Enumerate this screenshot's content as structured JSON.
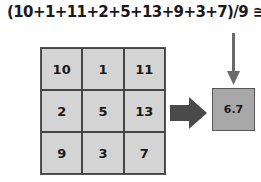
{
  "formula": "(10+1+11+2+5+13+9+3+7)/9 ≅ 6.7",
  "grid": {
    "cells": [
      [
        "10",
        "1",
        "11"
      ],
      [
        "2",
        "5",
        "13"
      ],
      [
        "9",
        "3",
        "7"
      ]
    ]
  },
  "result": "6.7",
  "colors": {
    "cell": "#d4d4d4",
    "result": "#a8a8a8",
    "arrow": "#5a5a5a"
  }
}
